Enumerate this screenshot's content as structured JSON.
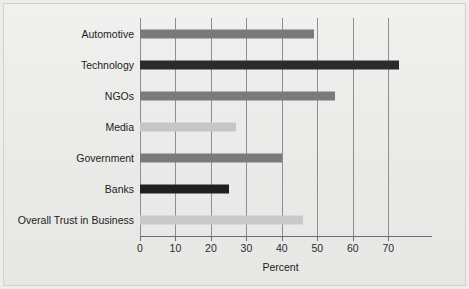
{
  "chart_data": {
    "type": "bar",
    "orientation": "horizontal",
    "title": "",
    "subtitle": "",
    "xlabel": "Percent",
    "ylabel": "",
    "categories": [
      "Automotive",
      "Technology",
      "NGOs",
      "Media",
      "Government",
      "Banks",
      "Overall Trust in Business"
    ],
    "values": [
      49,
      73,
      55,
      27,
      40,
      25,
      46
    ],
    "bar_colors": [
      "#7a7a7a",
      "#2b2b2b",
      "#7a7a7a",
      "#c6c6c6",
      "#7a7a7a",
      "#1f1f1f",
      "#c9c9c9"
    ],
    "xlim": [
      0,
      75
    ],
    "xticks": [
      0,
      10,
      20,
      30,
      40,
      50,
      60,
      70
    ],
    "xticklabels": [
      "0",
      "10",
      "20",
      "30",
      "40",
      "50",
      "60",
      "70"
    ],
    "gridlines": [
      0,
      10,
      20,
      30,
      40,
      50,
      60,
      70
    ],
    "grid": true,
    "grid_axis": "x",
    "legend": null,
    "legend_position": "none",
    "annotations": [],
    "background_color": "#ebebe9",
    "axis_color": "#6f6f6f",
    "grid_color": "#8e8e8e",
    "text_color": "#1b1b1b"
  }
}
